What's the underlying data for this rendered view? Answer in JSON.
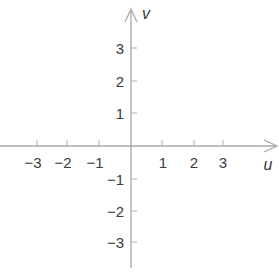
{
  "diagram": {
    "type": "coordinate-plane",
    "colors": {
      "axis": "#a8a8a8",
      "tick": "#b0b0b0",
      "label": "#3a3a3a",
      "background": "#ffffff"
    },
    "horizontal_axis": {
      "name": "u",
      "ticks": [
        {
          "value": -3,
          "label": "−3"
        },
        {
          "value": -2,
          "label": "−2"
        },
        {
          "value": -1,
          "label": "−1"
        },
        {
          "value": 1,
          "label": "1"
        },
        {
          "value": 2,
          "label": "2"
        },
        {
          "value": 3,
          "label": "3"
        }
      ]
    },
    "vertical_axis": {
      "name": "v",
      "ticks": [
        {
          "value": 3,
          "label": "3"
        },
        {
          "value": 2,
          "label": "2"
        },
        {
          "value": 1,
          "label": "1"
        },
        {
          "value": -1,
          "label": "−1"
        },
        {
          "value": -2,
          "label": "−2"
        },
        {
          "value": -3,
          "label": "−3"
        }
      ]
    }
  }
}
